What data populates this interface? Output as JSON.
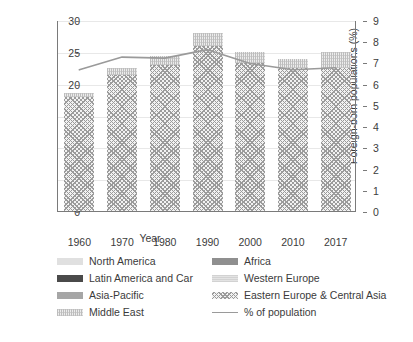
{
  "chart_data": {
    "type": "bar",
    "title": "",
    "subtitle": "",
    "xlabel": "Year",
    "ylabel": "Foreign-born population (millions)",
    "y2label": "Foreign-born populations (%)",
    "categories": [
      "1960",
      "1970",
      "1980",
      "1990",
      "2000",
      "2010",
      "2017"
    ],
    "ylim": [
      0,
      30
    ],
    "y2lim": [
      0,
      9
    ],
    "yticks": [
      "0",
      "5",
      "10",
      "15",
      "20",
      "25",
      "30"
    ],
    "ytick_values": [
      0,
      5,
      10,
      15,
      20,
      25,
      30
    ],
    "y2ticks": [
      "0",
      "1",
      "2",
      "3",
      "4",
      "5",
      "6",
      "7",
      "8",
      "9"
    ],
    "y2tick_values": [
      0,
      1,
      2,
      3,
      4,
      5,
      6,
      7,
      8,
      9
    ],
    "grid": true,
    "legend_position": "bottom",
    "stacked": true,
    "totals": [
      18.5,
      22.5,
      24.3,
      28.0,
      25.0,
      23.9,
      25.0
    ],
    "series": [
      {
        "name": "Eastern Europe & Central Asia",
        "fill": "fill-ee",
        "color": "#9b9b9b",
        "values": [
          17.9,
          21.4,
          23.0,
          25.9,
          23.2,
          22.4,
          22.4
        ]
      },
      {
        "name": "Middle East",
        "fill": "fill-me",
        "color": "#cfcfcf",
        "values": [
          0.6,
          1.1,
          1.3,
          2.1,
          1.8,
          1.5,
          2.6
        ]
      }
    ],
    "line_series": {
      "name": "% of population",
      "color": "#9a9a9a",
      "axis": "right",
      "values": [
        6.7,
        7.3,
        7.25,
        7.65,
        7.0,
        6.7,
        6.8
      ]
    }
  },
  "legend": {
    "items": [
      {
        "label": "North America",
        "swatch": "fill-na",
        "kind": "swatch",
        "col": 0,
        "row": 0
      },
      {
        "label": "Latin America and Car",
        "swatch": "fill-lac",
        "kind": "swatch",
        "col": 0,
        "row": 1
      },
      {
        "label": "Asia-Pacific",
        "swatch": "fill-ap",
        "kind": "swatch",
        "col": 0,
        "row": 2
      },
      {
        "label": "Middle East",
        "swatch": "fill-me",
        "kind": "swatch",
        "col": 0,
        "row": 3
      },
      {
        "label": "Africa",
        "swatch": "fill-af",
        "kind": "swatch",
        "col": 1,
        "row": 0
      },
      {
        "label": "Western Europe",
        "swatch": "fill-we",
        "kind": "swatch",
        "col": 1,
        "row": 1
      },
      {
        "label": "Eastern Europe & Central Asia",
        "swatch": "fill-ee",
        "kind": "swatch",
        "col": 1,
        "row": 2
      },
      {
        "label": "% of population",
        "swatch": "",
        "kind": "line",
        "col": 1,
        "row": 3
      }
    ]
  },
  "colors": {
    "axis": "#7a7a7a",
    "grid": "#e8e8e8",
    "text": "#3b3b3b",
    "line": "#9a9a9a",
    "background": "#ffffff"
  }
}
